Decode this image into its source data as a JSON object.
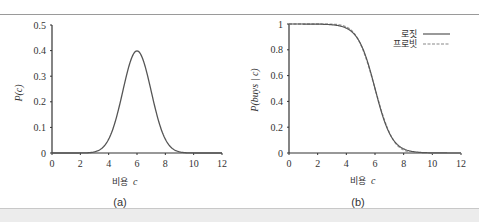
{
  "figure": {
    "panel_a": {
      "caption": "(a)",
      "xlabel": "비용",
      "xlabel_var": "c",
      "ylabel": "P(c)"
    },
    "panel_b": {
      "caption": "(b)",
      "xlabel": "비용",
      "xlabel_var": "c",
      "ylabel": "P(buys | c)",
      "legend": [
        "로짓",
        "프로빗"
      ]
    }
  },
  "chart_data": [
    {
      "type": "line",
      "title": "(a)",
      "xlabel": "비용 c",
      "ylabel": "P(c)",
      "xlim": [
        0,
        12
      ],
      "ylim": [
        0,
        0.5
      ],
      "xticks": [
        0,
        2,
        4,
        6,
        8,
        10,
        12
      ],
      "yticks": [
        0,
        0.1,
        0.2,
        0.3,
        0.4,
        0.5
      ],
      "grid": false,
      "series": [
        {
          "name": "Gaussian density (mean 6, sd 1)",
          "x": [
            0,
            2,
            3,
            4,
            4.5,
            5,
            5.5,
            6,
            6.5,
            7,
            7.5,
            8,
            9,
            10,
            12
          ],
          "y": [
            0,
            0.0001,
            0.004,
            0.054,
            0.13,
            0.242,
            0.352,
            0.399,
            0.352,
            0.242,
            0.13,
            0.054,
            0.004,
            0.0001,
            0
          ]
        }
      ]
    },
    {
      "type": "line",
      "title": "(b)",
      "xlabel": "비용 c",
      "ylabel": "P(buys | c)",
      "xlim": [
        0,
        12
      ],
      "ylim": [
        0,
        1
      ],
      "xticks": [
        0,
        2,
        4,
        6,
        8,
        10,
        12
      ],
      "yticks": [
        0,
        0.2,
        0.4,
        0.6,
        0.8,
        1
      ],
      "grid": false,
      "legend_position": "top-right",
      "series": [
        {
          "name": "로짓",
          "style": "solid",
          "x": [
            0,
            2,
            3,
            4,
            4.5,
            5,
            5.5,
            6,
            6.5,
            7,
            7.5,
            8,
            9,
            10,
            12
          ],
          "y": [
            1,
            0.999,
            0.994,
            0.962,
            0.915,
            0.834,
            0.71,
            0.5,
            0.29,
            0.166,
            0.085,
            0.038,
            0.006,
            0.001,
            0
          ]
        },
        {
          "name": "프로빗",
          "style": "dashed",
          "x": [
            0,
            2,
            3,
            4,
            4.5,
            5,
            5.5,
            6,
            6.5,
            7,
            7.5,
            8,
            9,
            10,
            12
          ],
          "y": [
            1,
            1,
            0.999,
            0.977,
            0.933,
            0.841,
            0.691,
            0.5,
            0.309,
            0.159,
            0.067,
            0.023,
            0.001,
            0,
            0
          ]
        }
      ]
    }
  ]
}
